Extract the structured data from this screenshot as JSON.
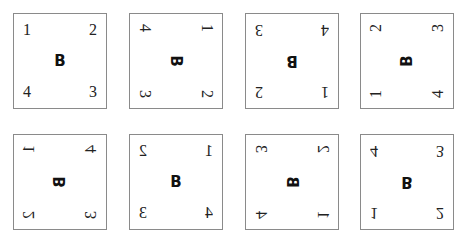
{
  "squares": [
    {
      "transform": "identity",
      "letter": "B",
      "tl": "1",
      "tr": "2",
      "bl": "4",
      "br": "3"
    },
    {
      "transform": "rotate-90",
      "letter": "B",
      "tl": "4",
      "tr": "1",
      "bl": "3",
      "br": "2"
    },
    {
      "transform": "rotate-180",
      "letter": "B",
      "tl": "3",
      "tr": "4",
      "bl": "2",
      "br": "1"
    },
    {
      "transform": "rotate-270",
      "letter": "B",
      "tl": "2",
      "tr": "3",
      "bl": "1",
      "br": "4"
    },
    {
      "transform": "reflect-diagonal",
      "letter": "B",
      "tl": "1",
      "tr": "4",
      "bl": "2",
      "br": "3"
    },
    {
      "transform": "reflect-vertical",
      "letter": "B",
      "tl": "2",
      "tr": "1",
      "bl": "3",
      "br": "4"
    },
    {
      "transform": "reflect-antidiagonal",
      "letter": "B",
      "tl": "3",
      "tr": "2",
      "bl": "4",
      "br": "1"
    },
    {
      "transform": "reflect-horizontal",
      "letter": "B",
      "tl": "4",
      "tr": "3",
      "bl": "1",
      "br": "2"
    }
  ]
}
